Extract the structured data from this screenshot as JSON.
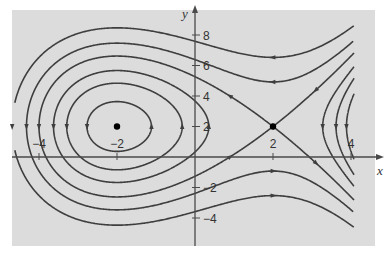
{
  "chart_data": {
    "type": "phase_portrait",
    "title": "",
    "xlabel": "x",
    "ylabel": "y",
    "xlim": [
      -4.6,
      4.6
    ],
    "ylim": [
      -5.8,
      9.5
    ],
    "x_ticks": [
      -4,
      -2,
      2,
      4
    ],
    "y_ticks": [
      8,
      6,
      4,
      2,
      -2,
      -4
    ],
    "x_tick_labels": [
      "−4",
      "−2",
      "2",
      "4"
    ],
    "y_tick_labels": [
      "8",
      "6",
      "4",
      "2",
      "−2",
      "−4"
    ],
    "system": {
      "dx_dt": "2 - y",
      "dy_dt": "4 - x^2"
    },
    "level_function": "(y-2)^2/2 = x^3/3 - 4x - C",
    "level_constants": [
      4.0,
      1.3,
      -1.4,
      -5.3333,
      -9.6,
      -15.6
    ],
    "equilibria": [
      {
        "name": "center",
        "x": -2,
        "y": 2
      },
      {
        "name": "saddle",
        "x": 2,
        "y": 2
      }
    ],
    "grid": false,
    "legend": null,
    "colors": {
      "background": "#dcdcdc",
      "curve": "#3e3e3e",
      "axis": "#4a4a4a",
      "point": "#000000"
    }
  }
}
